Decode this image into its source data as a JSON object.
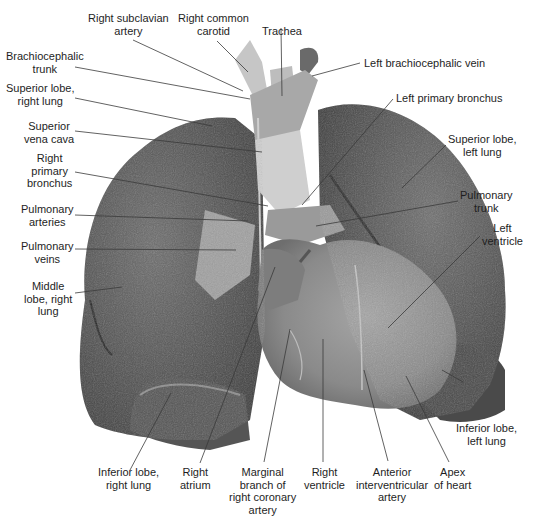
{
  "figure": {
    "colors": {
      "background": "#ffffff",
      "lung_dark": "#4a4a4a",
      "lung_mid": "#6b6b6b",
      "heart": "#8e8e8e",
      "vessels": "#b9b9b9",
      "leader_line": "#3a3a3a",
      "text": "#1e1e1e"
    }
  },
  "labels": {
    "right_subclavian_artery": [
      "Right subclavian",
      "artery"
    ],
    "right_common_carotid": [
      "Right common",
      "carotid"
    ],
    "trachea": [
      "Trachea"
    ],
    "brachiocephalic_trunk": [
      "Brachiocephalic",
      "trunk"
    ],
    "left_brachiocephalic_vein": [
      "Left brachiocephalic vein"
    ],
    "superior_lobe_right_lung": [
      "Superior lobe,",
      "right lung"
    ],
    "left_primary_bronchus": [
      "Left primary bronchus"
    ],
    "superior_vena_cava": [
      "Superior",
      "vena cava"
    ],
    "right_primary_bronchus": [
      "Right",
      "primary",
      "bronchus"
    ],
    "superior_lobe_left_lung": [
      "Superior lobe,",
      "left lung"
    ],
    "pulmonary_arteries": [
      "Pulmonary",
      "arteries"
    ],
    "pulmonary_trunk": [
      "Pulmonary",
      "trunk"
    ],
    "pulmonary_veins": [
      "Pulmonary",
      "veins"
    ],
    "left_ventricle": [
      "Left",
      "ventricle"
    ],
    "middle_lobe_right_lung": [
      "Middle",
      "lobe, right",
      "lung"
    ],
    "inferior_lobe_left_lung": [
      "Inferior lobe,",
      "left lung"
    ],
    "inferior_lobe_right_lung": [
      "Inferior lobe,",
      "right lung"
    ],
    "right_atrium": [
      "Right",
      "atrium"
    ],
    "marginal_branch": [
      "Marginal",
      "branch of",
      "right coronary",
      "artery"
    ],
    "right_ventricle": [
      "Right",
      "ventricle"
    ],
    "anterior_interventricular_artery": [
      "Anterior",
      "interventricular",
      "artery"
    ],
    "apex_of_heart": [
      "Apex",
      "of heart"
    ]
  }
}
